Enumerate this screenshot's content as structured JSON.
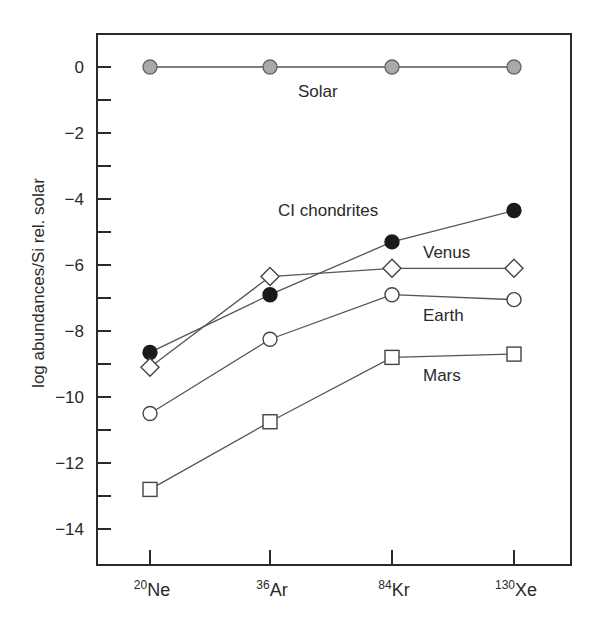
{
  "chart_data": {
    "type": "line",
    "title": "",
    "xlabel": "",
    "ylabel": "log abundances/Si rel. solar",
    "categories": [
      {
        "mass": "20",
        "element": "Ne"
      },
      {
        "mass": "36",
        "element": "Ar"
      },
      {
        "mass": "84",
        "element": "Kr"
      },
      {
        "mass": "130",
        "element": "Xe"
      }
    ],
    "ylim": [
      -15,
      1
    ],
    "yticks_major": [
      0,
      -2,
      -4,
      -6,
      -8,
      -10,
      -12,
      -14
    ],
    "yticks_minor": [
      -1,
      -3,
      -5,
      -7,
      -9,
      -11,
      -13
    ],
    "ytick_labels": [
      "0",
      "−2",
      "−4",
      "−6",
      "−8",
      "−10",
      "−12",
      "−14"
    ],
    "grid": false,
    "legend": "inline labels",
    "series": [
      {
        "name": "Solar",
        "marker": "circle",
        "fill": "#aaaaaa",
        "stroke": "#666666",
        "values": [
          0,
          0,
          0,
          0
        ],
        "label_pos": [
          298,
          97
        ]
      },
      {
        "name": "CI chondrites",
        "marker": "circle",
        "fill": "#1a1a1a",
        "stroke": "#1a1a1a",
        "values": [
          -8.65,
          -6.9,
          -5.3,
          -4.35
        ],
        "label_pos": [
          278,
          216
        ]
      },
      {
        "name": "Venus",
        "marker": "diamond",
        "fill": "#ffffff",
        "stroke": "#444444",
        "values": [
          -9.1,
          -6.35,
          -6.1,
          -6.1
        ],
        "label_pos": [
          423,
          258
        ]
      },
      {
        "name": "Earth",
        "marker": "circle",
        "fill": "#ffffff",
        "stroke": "#444444",
        "values": [
          -10.5,
          -8.25,
          -6.9,
          -7.05
        ],
        "label_pos": [
          423,
          321
        ]
      },
      {
        "name": "Mars",
        "marker": "square",
        "fill": "#ffffff",
        "stroke": "#444444",
        "values": [
          -12.8,
          -10.75,
          -8.8,
          -8.7
        ],
        "label_pos": [
          423,
          381
        ]
      }
    ]
  }
}
